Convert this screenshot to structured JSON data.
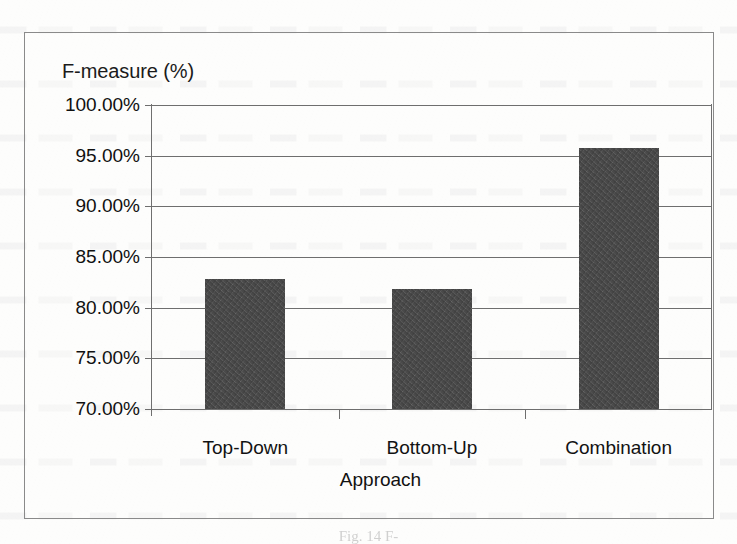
{
  "document": {
    "type": "scanned-figure",
    "caption": "Fig. 14 F-"
  },
  "chart_data": {
    "type": "bar",
    "title": "",
    "ylabel": "F-measure (%)",
    "xlabel": "Approach",
    "categories": [
      "Top-Down",
      "Bottom-Up",
      "Combination"
    ],
    "values": [
      82.8,
      81.8,
      95.8
    ],
    "value_labels": [
      "82.80%",
      "81.80%",
      "95.80%"
    ],
    "ylim": [
      70.0,
      100.0
    ],
    "ytick_labels": [
      "100.00%",
      "95.00%",
      "90.00%",
      "85.00%",
      "80.00%",
      "75.00%",
      "70.00%"
    ],
    "ytick_values": [
      100.0,
      95.0,
      90.0,
      85.0,
      80.0,
      75.0,
      70.0
    ],
    "grid": true,
    "grid_axis": "y",
    "legend": null,
    "legend_position": "none",
    "bar_color": "#4a4a4a",
    "grid_color": "#6e6e6e",
    "frame_color": "#8a8a8a",
    "background_color": "#fdfdfc"
  }
}
